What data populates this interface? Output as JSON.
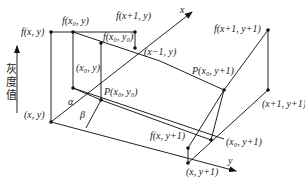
{
  "diagram": {
    "type": "bilinear-interpolation-geometry",
    "axis_labels": {
      "x": "x",
      "y": "y",
      "gray": [
        "灰",
        "度",
        "值"
      ]
    },
    "angles": {
      "alpha": "α",
      "beta": "β"
    },
    "labels": {
      "f_x_y": "f(x, y)",
      "f_x0_y": "f(x₀, y)",
      "f_x1_y": "f(x+1, y)",
      "f_x0_y0": "f(x₀, y₀)",
      "x_minus1_y": "(x−1, y)",
      "x0_y": "(x₀, y)",
      "x_y": "(x, y)",
      "P_x0_y0": "P(x₀, y₀)",
      "P_x0_y1": "P(x₀, y+1)",
      "f_x1_y1": "f(x+1, y+1)",
      "x1_y1": "(x+1, y+1)",
      "f_x_y1": "f(x, y+1)",
      "x0_y1": "(x₀, y+1)",
      "x_y1": "(x, y+1)"
    }
  }
}
